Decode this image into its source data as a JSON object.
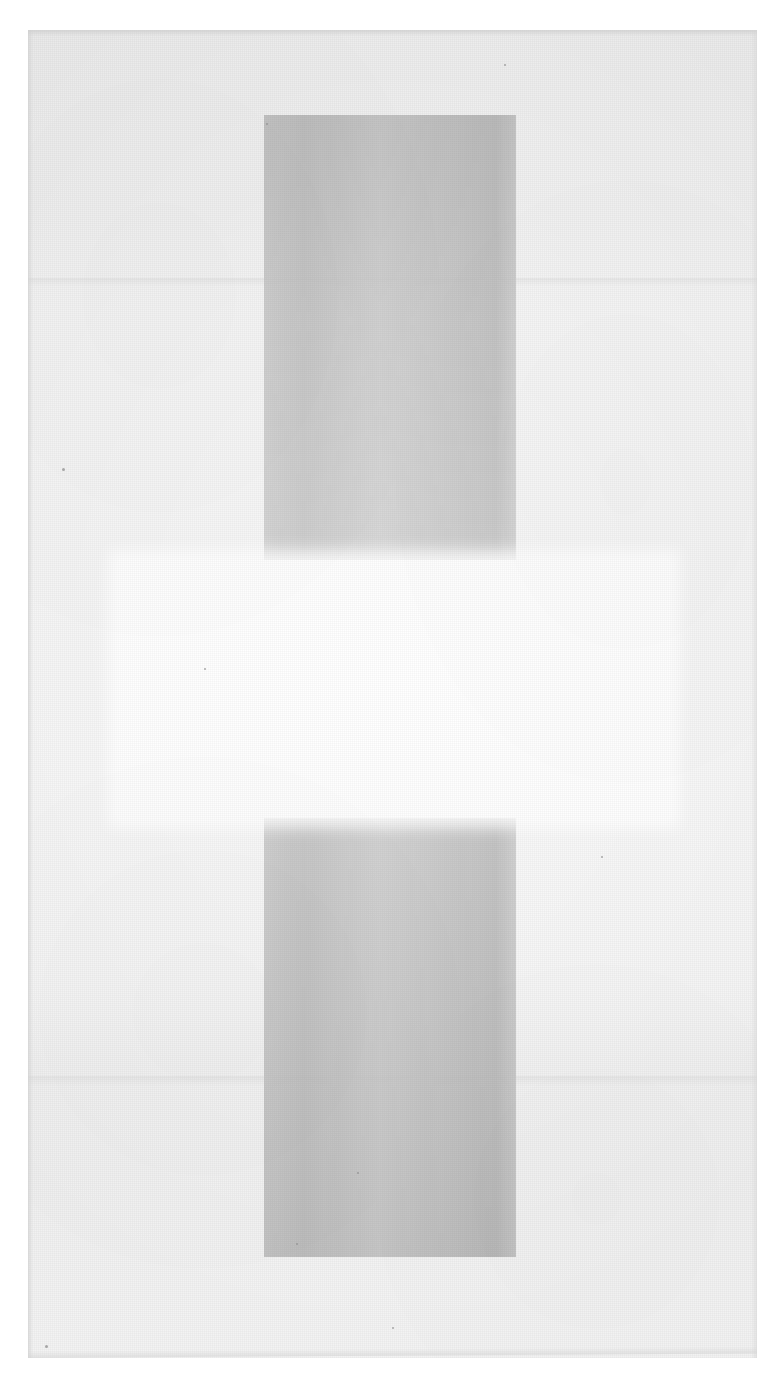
{
  "document": {
    "kind": "scanned-page",
    "caption": "",
    "text_content": "",
    "visible_text_present": false
  },
  "canvas": {
    "width": 781,
    "height": 1382,
    "background_color": "#ffffff"
  },
  "sheet": {
    "label": "",
    "left": 28,
    "top": 30,
    "width": 729,
    "height": 1328,
    "base_color": "#f0f0f0",
    "edge_shadow_color": "#cdcdcd"
  },
  "regions": {
    "vertical_band": {
      "label": "",
      "left": 264,
      "top": 115,
      "width": 252,
      "height": 1142,
      "color": "#c2c2c2"
    },
    "bright_band": {
      "label": "",
      "left": 118,
      "top": 560,
      "width": 552,
      "height": 258,
      "color": "#ffffff"
    },
    "tone_step_upper": {
      "label": "",
      "top": 278,
      "color": "#dedede"
    },
    "tone_step_lower": {
      "label": "",
      "top": 1076,
      "color": "#e0e0e0"
    }
  },
  "specks": [
    {
      "x": 62,
      "y": 468,
      "size": 3
    },
    {
      "x": 266,
      "y": 123,
      "size": 2
    },
    {
      "x": 504,
      "y": 64,
      "size": 2
    },
    {
      "x": 357,
      "y": 1172,
      "size": 2
    },
    {
      "x": 296,
      "y": 1243,
      "size": 2
    },
    {
      "x": 45,
      "y": 1345,
      "size": 3
    },
    {
      "x": 392,
      "y": 1327,
      "size": 2
    },
    {
      "x": 601,
      "y": 856,
      "size": 2
    },
    {
      "x": 204,
      "y": 668,
      "size": 2
    }
  ]
}
